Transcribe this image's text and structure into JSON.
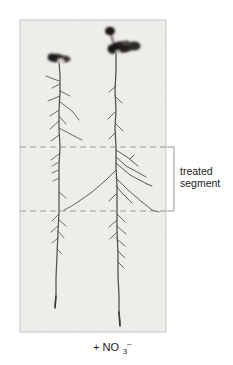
{
  "figure": {
    "type": "root-scan-photograph",
    "caption": "+ NO3-",
    "caption_parts": {
      "prefix": "+ NO",
      "subscript": "3",
      "superscript": "–"
    },
    "annotation": {
      "line1": "treated",
      "line2": "segment",
      "bracket_name": "treated-segment-bracket"
    },
    "panel": {
      "background_color": "#f0efec",
      "border_color": "#b9b9b5",
      "left": 20,
      "top": 20,
      "width": 146,
      "height": 312
    },
    "guides": [
      {
        "name": "upper-boundary-dashed-line",
        "y": 147,
        "color": "#8c8c8c"
      },
      {
        "name": "lower-boundary-dashed-line",
        "y": 211,
        "color": "#8c8c8c"
      }
    ],
    "seedlings": [
      {
        "name": "left-seedling",
        "label": "left seedling",
        "primary_root_x": 60,
        "cotyledon_color": "#2a2724",
        "lateral_root_counts": {
          "above_treated_segment": 9,
          "treated_segment": 5,
          "below_treated_segment": 6
        }
      },
      {
        "name": "right-seedling",
        "label": "right seedling",
        "primary_root_x": 116,
        "cotyledon_color": "#201d1b",
        "lateral_root_counts": {
          "above_treated_segment": 4,
          "treated_segment": 7,
          "below_treated_segment": 7
        }
      }
    ],
    "colors": {
      "root": "#55524e",
      "root_dark": "#2e2b28",
      "text": "#1b1b1b",
      "bracket": "#8a8a8a",
      "background": "#ffffff"
    }
  }
}
